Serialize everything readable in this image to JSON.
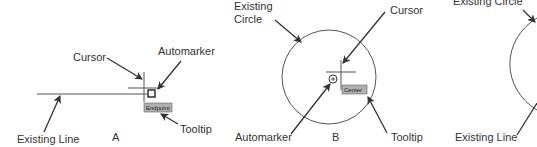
{
  "panels": [
    {
      "id": "A",
      "letter": "A",
      "labels": {
        "cursor": "Cursor",
        "automarker": "Automarker",
        "existing_object": "Existing Line",
        "tooltip": "Tooltip"
      },
      "tooltip_text": "Endpoint",
      "snap_type": "endpoint",
      "marker_icon": "square-marker-icon"
    },
    {
      "id": "B",
      "letter": "B",
      "labels": {
        "existing_object_line1": "Existing",
        "existing_object_line2": "Circle",
        "cursor": "Cursor",
        "automarker": "Automarker",
        "tooltip": "Tooltip"
      },
      "tooltip_text": "Center",
      "snap_type": "center",
      "marker_icon": "circle-marker-icon"
    },
    {
      "id": "C",
      "labels": {
        "existing_circle": "Existing Circle",
        "existing_line": "Existing Line"
      }
    }
  ],
  "colors": {
    "background": "#ffffff",
    "line": "#555555",
    "text": "#333333",
    "tooltip_bg": "#b0b0b0"
  }
}
